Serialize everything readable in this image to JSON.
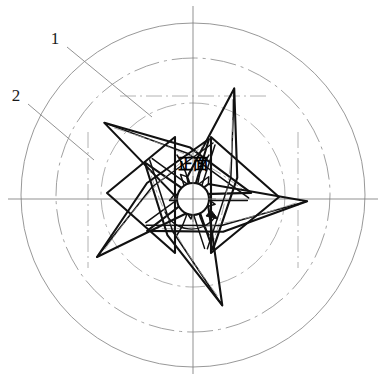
{
  "drawing": {
    "kind": "engineering-orthographic-front-view",
    "subject": "five-blade impeller / fan wheel front view",
    "background_color": "#ffffff",
    "ink_color": "#111111",
    "construction_color": "#8c8c8c",
    "centerline_color": "#6f6f6f",
    "canvas": {
      "width": 386,
      "height": 380
    }
  },
  "center_label": {
    "text": "正面",
    "meaning_note": "front face",
    "x": 193,
    "y": 169
  },
  "hub": {
    "name": "center-hub",
    "cx": 193,
    "cy": 199,
    "r": 16
  },
  "rotation_arrow": {
    "name": "rotation-direction-arrow",
    "direction": "clockwise",
    "arc_radius": 29,
    "arrow_tip_x": 218,
    "arrow_tip_y": 219
  },
  "circles": {
    "outer": {
      "cx": 193,
      "cy": 195,
      "r": 172,
      "style": "thin-solid"
    },
    "inner_dashdot": {
      "cx": 193,
      "cy": 195,
      "r": 137,
      "style": "dash-dot"
    },
    "blade_root_dashdot": {
      "cx": 193,
      "cy": 195,
      "r": 92,
      "style": "dash-dot"
    }
  },
  "centerlines": {
    "horizontal": {
      "x1": 8,
      "y1": 199,
      "x2": 378,
      "y2": 199
    },
    "vertical": {
      "x1": 193,
      "y1": 6,
      "x2": 193,
      "y2": 374
    }
  },
  "callouts": [
    {
      "id": "callout-1",
      "label": "1",
      "label_x": 55,
      "label_y": 44,
      "leader_from_x": 67,
      "leader_from_y": 47,
      "leader_to_x": 152,
      "leader_to_y": 117,
      "points_to": "blade outer tip / leading edge"
    },
    {
      "id": "callout-2",
      "label": "2",
      "label_x": 16,
      "label_y": 101,
      "leader_from_x": 28,
      "leader_from_y": 104,
      "leader_to_x": 94,
      "leader_to_y": 160,
      "points_to": "blade root / hub attachment"
    }
  ],
  "blades": {
    "count": 5,
    "pitch_degrees": 72,
    "base_rotation_degrees": -18,
    "description": "angular sheet-metal blades arranged with five-fold rotational symmetry about the hub"
  }
}
